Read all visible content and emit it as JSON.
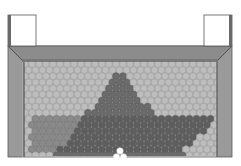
{
  "diagram": {
    "type": "hopper-granular-packing",
    "colors": {
      "background": "#ffffff",
      "post_fill": "#ffffff",
      "post_stroke": "#555555",
      "post_shadow": "#6a6a6a",
      "wall": "#9a9a9a",
      "wall_top": "#8c8c8c",
      "wall_stroke": "#5a5a5a",
      "packing_border": "#3a3a3a",
      "disc_light": "#bdbdbd",
      "disc_light_edge": "#a3a3a3",
      "disc_mid": "#8a8a8a",
      "disc_mid_edge": "#767676",
      "disc_dark": "#6b6b6b",
      "disc_dark_edge": "#5a5a5a",
      "disc_darker": "#5e5e5e",
      "outlet_disc": "#ffffff"
    },
    "regions": [
      {
        "name": "light-packing",
        "shade": "light"
      },
      {
        "name": "stagnant-triangle",
        "shade": "dark"
      },
      {
        "name": "flow-band",
        "shade": "darker"
      },
      {
        "name": "lower-left-packing",
        "shade": "mid"
      }
    ],
    "outlet": {
      "x": 120,
      "y": 157,
      "label": ""
    }
  }
}
